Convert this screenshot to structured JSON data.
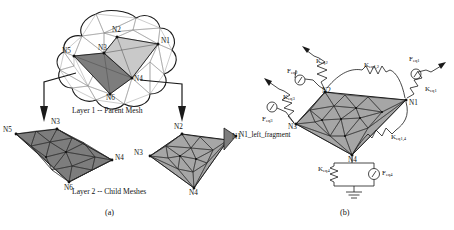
{
  "figure": {
    "panel_a": {
      "caption": "(a)",
      "layer1_caption": "Layer 1 -- Parent Mesh",
      "layer2_caption": "Layer 2 -- Child Meshes",
      "parent_nodes": [
        {
          "id": "N1",
          "x": 158,
          "y": 44
        },
        {
          "id": "N2",
          "x": 117,
          "y": 37
        },
        {
          "id": "N3",
          "x": 104,
          "y": 53
        },
        {
          "id": "N4",
          "x": 132,
          "y": 78
        },
        {
          "id": "N5",
          "x": 74,
          "y": 56
        },
        {
          "id": "N6",
          "x": 110,
          "y": 94
        }
      ],
      "left_child_nodes": [
        {
          "id": "N5",
          "x": 8,
          "y": 134
        },
        {
          "id": "N3",
          "x": 55,
          "y": 126
        },
        {
          "id": "N4",
          "x": 105,
          "y": 160
        },
        {
          "id": "N6",
          "x": 63,
          "y": 185
        }
      ],
      "right_child_nodes": [
        {
          "id": "N2",
          "x": 172,
          "y": 131
        },
        {
          "id": "N1",
          "x": 228,
          "y": 136
        },
        {
          "id": "N3",
          "x": 140,
          "y": 156
        },
        {
          "id": "N4",
          "x": 188,
          "y": 190
        }
      ]
    },
    "panel_b": {
      "caption": "(b)",
      "nodes": [
        {
          "id": "N1",
          "x": 406,
          "y": 100
        },
        {
          "id": "N2",
          "x": 325,
          "y": 90
        },
        {
          "id": "N3",
          "x": 296,
          "y": 124
        },
        {
          "id": "N4",
          "x": 352,
          "y": 157
        },
        {
          "id": "N1_left_fragment",
          "x": 237,
          "y": 138
        }
      ],
      "elements": [
        {
          "name": "K_eq2",
          "base": "K",
          "sub": "eq2",
          "x": 318,
          "y": 63
        },
        {
          "name": "F_eq2",
          "base": "F",
          "sub": "eq2",
          "x": 296,
          "y": 74
        },
        {
          "name": "K_eq1,2",
          "base": "K",
          "sub": "eq1,2",
          "x": 368,
          "y": 70
        },
        {
          "name": "F_eq1",
          "base": "F",
          "sub": "eq1",
          "x": 413,
          "y": 64
        },
        {
          "name": "K_eq1",
          "base": "K",
          "sub": "eq1",
          "x": 426,
          "y": 92
        },
        {
          "name": "K_eq3",
          "base": "K",
          "sub": "eq3",
          "x": 280,
          "y": 100
        },
        {
          "name": "F_eq3",
          "base": "F",
          "sub": "eq3",
          "x": 262,
          "y": 122
        },
        {
          "name": "K_eq1,4",
          "base": "K",
          "sub": "eq1,4",
          "x": 396,
          "y": 139
        },
        {
          "name": "K_eq4",
          "base": "K",
          "sub": "eq4",
          "x": 338,
          "y": 172
        },
        {
          "name": "F_eq4",
          "base": "F",
          "sub": "eq4",
          "x": 379,
          "y": 175
        }
      ]
    },
    "colors": {
      "mesh_light": "#c9c9c9",
      "mesh_mid": "#a6a6a6",
      "mesh_dark": "#7d7d7d",
      "line": "#1a1a1a",
      "thin_line": "#8e8e8e"
    },
    "footer_text": "page footer text partially cropped"
  }
}
